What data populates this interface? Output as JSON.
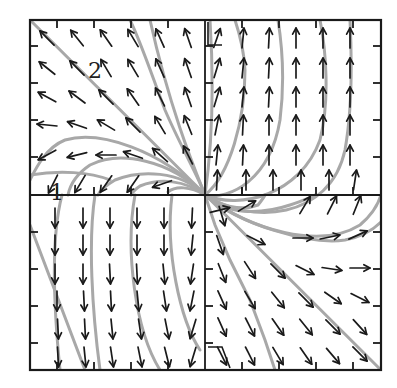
{
  "diagram": {
    "type": "phase-portrait",
    "frame": {
      "left": 30,
      "top": 20,
      "right": 381,
      "bottom": 370
    },
    "origin": {
      "x": 205,
      "y": 195
    },
    "colors": {
      "frame": "#1a1a1a",
      "arrows": "#1a1a1a",
      "trajectories": "#a8a8a8",
      "background": "#ffffff"
    },
    "labels": [
      {
        "id": "region-2",
        "text": "2",
        "x": 88,
        "y": 78
      },
      {
        "id": "region-1",
        "text": "1",
        "x": 50,
        "y": 200
      }
    ],
    "ticks": {
      "top": [
        57,
        94,
        131,
        168,
        242,
        279,
        316,
        353
      ],
      "bottom": [
        57,
        94,
        131,
        168,
        242,
        279,
        316,
        353
      ],
      "left": [
        46,
        83,
        120,
        157,
        232,
        269,
        306,
        343
      ],
      "right": [
        46,
        83,
        120,
        157,
        232,
        269,
        306,
        343
      ],
      "length": 8
    },
    "markers": [
      {
        "id": "triangle-top",
        "points": "208,22 208,45 222,45"
      },
      {
        "id": "triangle-bottom",
        "points": "208,347 222,347 230,368"
      }
    ]
  },
  "chart_data": {
    "type": "vector-field",
    "title": "",
    "xlabel": "",
    "ylabel": "",
    "grid": false,
    "quadrants": {
      "upper_left": "vectors point up-left; leftward near x-axis",
      "upper_right": "vectors point straight up",
      "lower_left": "vectors point straight down",
      "lower_right": "vectors point down-right; rightward near x-axis"
    },
    "separatrix": "straight line from top-left corner to bottom-right corner through origin",
    "region_labels": [
      "1",
      "2"
    ]
  },
  "arrows": [
    {
      "x": 47,
      "y": 38,
      "dx": -1,
      "dy": -1
    },
    {
      "x": 77,
      "y": 38,
      "dx": -0.8,
      "dy": -1
    },
    {
      "x": 106,
      "y": 38,
      "dx": -0.7,
      "dy": -1
    },
    {
      "x": 133,
      "y": 38,
      "dx": -0.6,
      "dy": -1
    },
    {
      "x": 160,
      "y": 38,
      "dx": -0.45,
      "dy": -1
    },
    {
      "x": 188,
      "y": 38,
      "dx": -0.35,
      "dy": -1
    },
    {
      "x": 47,
      "y": 68,
      "dx": -1,
      "dy": -0.8
    },
    {
      "x": 77,
      "y": 68,
      "dx": -1,
      "dy": -1
    },
    {
      "x": 106,
      "y": 68,
      "dx": -0.6,
      "dy": -1
    },
    {
      "x": 133,
      "y": 68,
      "dx": -0.6,
      "dy": -1
    },
    {
      "x": 160,
      "y": 68,
      "dx": -0.45,
      "dy": -1
    },
    {
      "x": 188,
      "y": 68,
      "dx": -0.35,
      "dy": -1
    },
    {
      "x": 47,
      "y": 97,
      "dx": -1,
      "dy": -0.55
    },
    {
      "x": 77,
      "y": 97,
      "dx": -1,
      "dy": -0.75
    },
    {
      "x": 106,
      "y": 97,
      "dx": -1,
      "dy": -1
    },
    {
      "x": 133,
      "y": 97,
      "dx": -0.7,
      "dy": -1
    },
    {
      "x": 160,
      "y": 97,
      "dx": -0.5,
      "dy": -1
    },
    {
      "x": 188,
      "y": 97,
      "dx": -0.35,
      "dy": -1
    },
    {
      "x": 47,
      "y": 125,
      "dx": -1,
      "dy": -0.1
    },
    {
      "x": 77,
      "y": 125,
      "dx": -1,
      "dy": -0.35
    },
    {
      "x": 106,
      "y": 125,
      "dx": -1,
      "dy": -0.6
    },
    {
      "x": 133,
      "y": 125,
      "dx": -1,
      "dy": -1
    },
    {
      "x": 160,
      "y": 125,
      "dx": -0.6,
      "dy": -1
    },
    {
      "x": 188,
      "y": 125,
      "dx": -0.4,
      "dy": -1
    },
    {
      "x": 47,
      "y": 155,
      "dx": -1,
      "dy": 0.55
    },
    {
      "x": 77,
      "y": 155,
      "dx": -1,
      "dy": 0.25
    },
    {
      "x": 106,
      "y": 155,
      "dx": -1,
      "dy": 0
    },
    {
      "x": 133,
      "y": 155,
      "dx": -1,
      "dy": -0.35
    },
    {
      "x": 160,
      "y": 155,
      "dx": -1,
      "dy": -0.9
    },
    {
      "x": 188,
      "y": 155,
      "dx": -0.5,
      "dy": -1
    },
    {
      "x": 53,
      "y": 184,
      "dx": -0.5,
      "dy": 1
    },
    {
      "x": 80,
      "y": 184,
      "dx": -0.6,
      "dy": 1
    },
    {
      "x": 106,
      "y": 184,
      "dx": -0.7,
      "dy": 1
    },
    {
      "x": 133,
      "y": 184,
      "dx": -0.7,
      "dy": 1
    },
    {
      "x": 162,
      "y": 184,
      "dx": -1,
      "dy": 0.35
    },
    {
      "x": 217,
      "y": 38,
      "dx": 0.35,
      "dy": -1
    },
    {
      "x": 243,
      "y": 38,
      "dx": 0.1,
      "dy": -1
    },
    {
      "x": 269,
      "y": 38,
      "dx": 0.05,
      "dy": -1
    },
    {
      "x": 296,
      "y": 38,
      "dx": 0,
      "dy": -1
    },
    {
      "x": 323,
      "y": 38,
      "dx": 0,
      "dy": -1
    },
    {
      "x": 350,
      "y": 38,
      "dx": 0,
      "dy": -1
    },
    {
      "x": 217,
      "y": 68,
      "dx": 0.3,
      "dy": -1
    },
    {
      "x": 243,
      "y": 68,
      "dx": 0.1,
      "dy": -1
    },
    {
      "x": 269,
      "y": 68,
      "dx": 0.05,
      "dy": -1
    },
    {
      "x": 296,
      "y": 68,
      "dx": 0,
      "dy": -1
    },
    {
      "x": 323,
      "y": 68,
      "dx": 0,
      "dy": -1
    },
    {
      "x": 350,
      "y": 68,
      "dx": 0,
      "dy": -1
    },
    {
      "x": 217,
      "y": 97,
      "dx": 0.3,
      "dy": -1
    },
    {
      "x": 243,
      "y": 97,
      "dx": 0.1,
      "dy": -1
    },
    {
      "x": 269,
      "y": 97,
      "dx": 0.05,
      "dy": -1
    },
    {
      "x": 296,
      "y": 97,
      "dx": 0,
      "dy": -1
    },
    {
      "x": 323,
      "y": 97,
      "dx": 0,
      "dy": -1
    },
    {
      "x": 350,
      "y": 97,
      "dx": 0,
      "dy": -1
    },
    {
      "x": 217,
      "y": 125,
      "dx": 0.2,
      "dy": -1
    },
    {
      "x": 243,
      "y": 125,
      "dx": 0.05,
      "dy": -1
    },
    {
      "x": 269,
      "y": 125,
      "dx": 0,
      "dy": -1
    },
    {
      "x": 296,
      "y": 125,
      "dx": 0,
      "dy": -1
    },
    {
      "x": 323,
      "y": 125,
      "dx": 0,
      "dy": -1
    },
    {
      "x": 350,
      "y": 125,
      "dx": 0,
      "dy": -1
    },
    {
      "x": 217,
      "y": 155,
      "dx": 0.1,
      "dy": -1
    },
    {
      "x": 243,
      "y": 155,
      "dx": 0.05,
      "dy": -1
    },
    {
      "x": 269,
      "y": 155,
      "dx": 0,
      "dy": -1
    },
    {
      "x": 296,
      "y": 155,
      "dx": 0,
      "dy": -1
    },
    {
      "x": 323,
      "y": 155,
      "dx": 0,
      "dy": -1
    },
    {
      "x": 350,
      "y": 155,
      "dx": 0,
      "dy": -1
    },
    {
      "x": 217,
      "y": 180,
      "dx": 0.05,
      "dy": -1
    },
    {
      "x": 246,
      "y": 180,
      "dx": 0,
      "dy": -1
    },
    {
      "x": 273,
      "y": 180,
      "dx": 0,
      "dy": -1
    },
    {
      "x": 301,
      "y": 180,
      "dx": 0,
      "dy": -1
    },
    {
      "x": 329,
      "y": 180,
      "dx": 0,
      "dy": -1
    },
    {
      "x": 355,
      "y": 180,
      "dx": 0.15,
      "dy": -1
    },
    {
      "x": 55,
      "y": 218,
      "dx": 0,
      "dy": 1
    },
    {
      "x": 83,
      "y": 218,
      "dx": 0,
      "dy": 1
    },
    {
      "x": 110,
      "y": 218,
      "dx": 0,
      "dy": 1
    },
    {
      "x": 137,
      "y": 218,
      "dx": 0,
      "dy": 1
    },
    {
      "x": 164,
      "y": 218,
      "dx": 0,
      "dy": 1
    },
    {
      "x": 192,
      "y": 218,
      "dx": -0.05,
      "dy": 1
    },
    {
      "x": 55,
      "y": 245,
      "dx": 0,
      "dy": 1
    },
    {
      "x": 83,
      "y": 245,
      "dx": 0,
      "dy": 1
    },
    {
      "x": 110,
      "y": 245,
      "dx": 0,
      "dy": 1
    },
    {
      "x": 137,
      "y": 245,
      "dx": 0,
      "dy": 1
    },
    {
      "x": 164,
      "y": 245,
      "dx": 0,
      "dy": 1
    },
    {
      "x": 192,
      "y": 245,
      "dx": -0.1,
      "dy": 1
    },
    {
      "x": 55,
      "y": 274,
      "dx": 0,
      "dy": 1
    },
    {
      "x": 83,
      "y": 274,
      "dx": 0,
      "dy": 1
    },
    {
      "x": 110,
      "y": 274,
      "dx": 0.05,
      "dy": 1
    },
    {
      "x": 137,
      "y": 274,
      "dx": 0.05,
      "dy": 1
    },
    {
      "x": 164,
      "y": 274,
      "dx": 0.1,
      "dy": 1
    },
    {
      "x": 192,
      "y": 274,
      "dx": -0.15,
      "dy": 1
    },
    {
      "x": 57,
      "y": 301,
      "dx": 0,
      "dy": 1
    },
    {
      "x": 84,
      "y": 301,
      "dx": 0.05,
      "dy": 1
    },
    {
      "x": 111,
      "y": 301,
      "dx": 0.05,
      "dy": 1
    },
    {
      "x": 138,
      "y": 301,
      "dx": 0.1,
      "dy": 1
    },
    {
      "x": 165,
      "y": 301,
      "dx": 0.15,
      "dy": 1
    },
    {
      "x": 192,
      "y": 301,
      "dx": -0.2,
      "dy": 1
    },
    {
      "x": 58,
      "y": 329,
      "dx": 0.05,
      "dy": 1
    },
    {
      "x": 85,
      "y": 329,
      "dx": 0.05,
      "dy": 1
    },
    {
      "x": 112,
      "y": 329,
      "dx": 0.1,
      "dy": 1
    },
    {
      "x": 140,
      "y": 329,
      "dx": 0.15,
      "dy": 1
    },
    {
      "x": 167,
      "y": 329,
      "dx": 0.2,
      "dy": 1
    },
    {
      "x": 193,
      "y": 329,
      "dx": -0.3,
      "dy": 1
    },
    {
      "x": 58,
      "y": 357,
      "dx": 0.05,
      "dy": 1
    },
    {
      "x": 85,
      "y": 357,
      "dx": 0.1,
      "dy": 1
    },
    {
      "x": 112,
      "y": 357,
      "dx": 0.15,
      "dy": 1
    },
    {
      "x": 140,
      "y": 357,
      "dx": 0.2,
      "dy": 1
    },
    {
      "x": 167,
      "y": 357,
      "dx": 0.25,
      "dy": 1
    },
    {
      "x": 193,
      "y": 357,
      "dx": -0.3,
      "dy": 1
    },
    {
      "x": 220,
      "y": 210,
      "dx": 1,
      "dy": -0.25
    },
    {
      "x": 247,
      "y": 206,
      "dx": 1,
      "dy": -0.6
    },
    {
      "x": 305,
      "y": 205,
      "dx": 0.6,
      "dy": -1
    },
    {
      "x": 332,
      "y": 205,
      "dx": 0.5,
      "dy": -1
    },
    {
      "x": 357,
      "y": 205,
      "dx": 0.4,
      "dy": -1
    },
    {
      "x": 222,
      "y": 216,
      "dx": 0.3,
      "dy": 1
    },
    {
      "x": 220,
      "y": 245,
      "dx": 0.35,
      "dy": 1
    },
    {
      "x": 256,
      "y": 240,
      "dx": 1,
      "dy": 0.5
    },
    {
      "x": 303,
      "y": 238,
      "dx": 1,
      "dy": 0
    },
    {
      "x": 330,
      "y": 237,
      "dx": 1,
      "dy": -0.2
    },
    {
      "x": 358,
      "y": 235,
      "dx": 1,
      "dy": -0.45
    },
    {
      "x": 222,
      "y": 273,
      "dx": 0.4,
      "dy": 1
    },
    {
      "x": 250,
      "y": 270,
      "dx": 0.65,
      "dy": 1
    },
    {
      "x": 278,
      "y": 271,
      "dx": 1,
      "dy": 1
    },
    {
      "x": 305,
      "y": 270,
      "dx": 1,
      "dy": 0.5
    },
    {
      "x": 332,
      "y": 269,
      "dx": 1,
      "dy": 0.15
    },
    {
      "x": 360,
      "y": 268,
      "dx": 1,
      "dy": 0
    },
    {
      "x": 222,
      "y": 300,
      "dx": 0.45,
      "dy": 1
    },
    {
      "x": 250,
      "y": 300,
      "dx": 0.6,
      "dy": 1
    },
    {
      "x": 278,
      "y": 300,
      "dx": 0.8,
      "dy": 1
    },
    {
      "x": 306,
      "y": 300,
      "dx": 1,
      "dy": 1
    },
    {
      "x": 333,
      "y": 298,
      "dx": 1,
      "dy": 0.7
    },
    {
      "x": 360,
      "y": 298,
      "dx": 1,
      "dy": 0.5
    },
    {
      "x": 222,
      "y": 327,
      "dx": 0.45,
      "dy": 1
    },
    {
      "x": 250,
      "y": 327,
      "dx": 0.5,
      "dy": 1
    },
    {
      "x": 278,
      "y": 327,
      "dx": 0.7,
      "dy": 1
    },
    {
      "x": 306,
      "y": 327,
      "dx": 0.8,
      "dy": 1
    },
    {
      "x": 333,
      "y": 327,
      "dx": 1,
      "dy": 1
    },
    {
      "x": 360,
      "y": 327,
      "dx": 0.9,
      "dy": 1
    },
    {
      "x": 222,
      "y": 356,
      "dx": 0.5,
      "dy": 1
    },
    {
      "x": 250,
      "y": 356,
      "dx": 0.5,
      "dy": 1
    },
    {
      "x": 278,
      "y": 356,
      "dx": 0.6,
      "dy": 1
    },
    {
      "x": 306,
      "y": 356,
      "dx": 0.7,
      "dy": 1
    },
    {
      "x": 333,
      "y": 356,
      "dx": 0.85,
      "dy": 1
    },
    {
      "x": 360,
      "y": 354,
      "dx": 1,
      "dy": 1
    }
  ],
  "trajectories": [
    "M 30 20 L 381 370",
    "M 205 195 C 200 180, 180 145, 165 110 C 150 70, 140 40, 130 20",
    "M 205 195 C 195 170, 170 110, 150 20",
    "M 205 195 C 160 150, 100 130, 65 140 C 45 148, 35 170, 30 180",
    "M 205 195 C 170 160, 120 150, 90 165 C 75 175, 70 185, 68 195",
    "M 205 195 C 180 170, 140 170, 115 180 C 105 186, 100 190, 98 195",
    "M 205 195 C 185 180, 160 178, 140 186 C 134 190, 132 193, 131 195",
    "M 205 195 C 190 186, 175 186, 168 192",
    "M 30 175 C 60 170, 90 172, 110 180",
    "M 62 195 C 50 240, 55 320, 60 370",
    "M 95 195 C 88 240, 92 310, 100 370",
    "M 135 195 C 125 250, 135 330, 160 370",
    "M 172 195 C 165 250, 180 320, 200 350",
    "M 205 195 L 215 225 L 230 260 L 250 300 L 265 340 L 275 370",
    "M 205 195 C 210 160, 215 100, 210 20",
    "M 205 195 C 230 175, 245 120, 245 70 C 244 50, 240 35, 235 20",
    "M 205 195 C 230 200, 270 180, 280 120 C 285 80, 282 45, 278 20",
    "M 205 195 C 240 210, 300 195, 320 140 C 330 100, 326 50, 320 20",
    "M 205 195 C 250 225, 330 220, 345 150 C 352 110, 352 60, 350 20",
    "M 205 195 C 250 230, 320 250, 360 225 C 372 215, 378 205, 381 195",
    "M 205 195 C 240 225, 310 245, 345 240 C 362 237, 373 230, 381 222",
    "M 205 195 C 225 215, 260 215, 290 205 C 305 200, 312 197, 315 195",
    "M 205 195 C 220 205, 240 212, 258 205 C 262 200, 264 197, 265 195",
    "M 30 225 L 85 370"
  ]
}
